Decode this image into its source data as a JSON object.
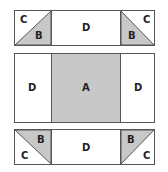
{
  "colors": {
    "border": "#555555",
    "shade": "#c8c8c8",
    "white": "#ffffff",
    "text": "#222222"
  },
  "top_row": {
    "left_square": {
      "upper_label": "C",
      "lower_label": "B"
    },
    "center_label": "D",
    "right_square": {
      "upper_label": "C",
      "lower_label": "B"
    }
  },
  "middle_row": {
    "left_label": "D",
    "center_label": "A",
    "right_label": "D"
  },
  "bottom_row": {
    "left_square": {
      "upper_label": "B",
      "lower_label": "C"
    },
    "center_label": "D",
    "right_square": {
      "upper_label": "B",
      "lower_label": "C"
    }
  }
}
